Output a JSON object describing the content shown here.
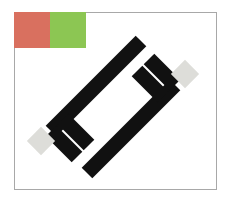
{
  "stage": {
    "width": 229,
    "height": 202,
    "background_color": "#ffffff"
  },
  "canvas": {
    "name": "drawing-canvas",
    "x": 14,
    "y": 12,
    "width": 203,
    "height": 178,
    "fill_color": "#ffffff",
    "border_color": "#a8a8a8",
    "border_width": 1
  },
  "swatches": [
    {
      "name": "red-swatch",
      "label": "red",
      "color": "#d9705f",
      "x": 0,
      "y": 0,
      "width": 36,
      "height": 36
    },
    {
      "name": "green-swatch",
      "label": "green",
      "color": "#8cc653",
      "x": 36,
      "y": 0,
      "width": 36,
      "height": 36
    }
  ],
  "shape": {
    "name": "bracket-figure",
    "description": "H-bracket figure rotated diagonally",
    "fill_color": "#111111",
    "rotation_degrees": -45,
    "stroke_width": 15,
    "segments": [
      {
        "name": "long-bar-upper",
        "x1": 36,
        "y1": 118,
        "x2": 126,
        "y2": 28
      },
      {
        "name": "long-bar-lower",
        "x1": 72,
        "y1": 160,
        "x2": 160,
        "y2": 72
      },
      {
        "name": "stub-arm-left",
        "x1": 36,
        "y1": 118,
        "x2": 62,
        "y2": 144
      },
      {
        "name": "cross-bar-left",
        "x1": 48,
        "y1": 106,
        "x2": 74,
        "y2": 132
      },
      {
        "name": "stub-arm-right",
        "x1": 160,
        "y1": 72,
        "x2": 134,
        "y2": 46
      },
      {
        "name": "cross-bar-right",
        "x1": 148,
        "y1": 84,
        "x2": 122,
        "y2": 58
      }
    ]
  },
  "endcaps": [
    {
      "name": "endcap-northeast",
      "color": "#ddddd9",
      "cx": 170,
      "cy": 61,
      "size": 20,
      "rotation_degrees": 45
    },
    {
      "name": "endcap-southwest",
      "color": "#ddddd9",
      "cx": 26,
      "cy": 128,
      "size": 20,
      "rotation_degrees": 45
    }
  ]
}
